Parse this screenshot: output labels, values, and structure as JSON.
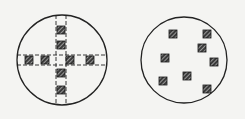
{
  "figure": {
    "colors": {
      "background": "#f4f4f2",
      "stroke": "#222222",
      "colony_fill": "#3a3a3a",
      "hatch": "#d8d8d8"
    },
    "plates": [
      {
        "id": "left",
        "pattern": "cross",
        "colonies_vertical": 4,
        "colonies_horizontal": 4
      },
      {
        "id": "right",
        "pattern": "scattered",
        "colonies": 8
      }
    ]
  }
}
